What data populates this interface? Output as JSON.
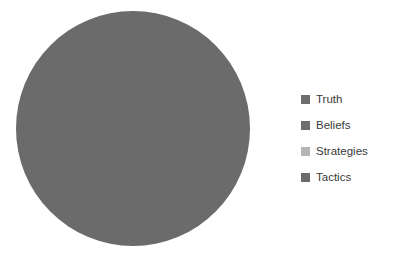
{
  "background_color": "#ffffff",
  "text_color": "#3a3a3a",
  "legend": {
    "position": "right",
    "items": [
      {
        "label": "Truth",
        "color": "#6e6e6e"
      },
      {
        "label": "Beliefs",
        "color": "#6e6e6e"
      },
      {
        "label": "Strategies",
        "color": "#b5b5b5"
      },
      {
        "label": "Tactics",
        "color": "#6b6b6b"
      }
    ]
  },
  "chart_data": {
    "type": "pie",
    "title": "",
    "subtitle": "",
    "xlabel": "",
    "ylabel": "",
    "grid": false,
    "legend_position": "right",
    "labels": [
      "Truth",
      "Beliefs",
      "Strategies",
      "Tactics"
    ],
    "values": [
      100,
      0,
      0,
      0
    ],
    "colors": [
      "#6b6b6b",
      "#6e6e6e",
      "#b5b5b5",
      "#6b6b6b"
    ],
    "start_angle": 90,
    "direction": "counterclockwise",
    "radius_px": 117,
    "center_px": [
      133,
      128
    ]
  }
}
